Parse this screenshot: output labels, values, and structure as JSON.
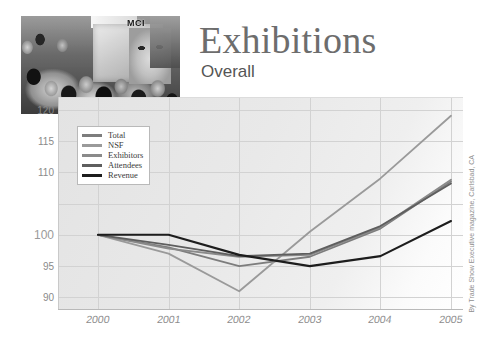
{
  "header": {
    "title": "Exhibitions",
    "subtitle": "Overall",
    "photo_alt": "trade-show-crowd-photo",
    "photo_sign_text": "MCI"
  },
  "credit": "By Trade Show Executive magazine, Carlsbad, CA",
  "chart_data": {
    "type": "line",
    "title": "Exhibitions",
    "subtitle": "Overall",
    "xlabel": "",
    "ylabel": "",
    "x": [
      "2000",
      "2001",
      "2002",
      "2003",
      "2004",
      "2005"
    ],
    "categories": [
      "2000",
      "2001",
      "2002",
      "2003",
      "2004",
      "2005"
    ],
    "ylim": [
      88,
      122
    ],
    "yticks": [
      120,
      115,
      110,
      100,
      95,
      90
    ],
    "ytick_labels": [
      "120",
      "115",
      "110",
      "100",
      "95",
      "90"
    ],
    "grid": true,
    "legend_position": "top-left",
    "series": [
      {
        "name": "Total",
        "color": "#7d7d7d",
        "values": [
          100,
          98.0,
          95.0,
          96.5,
          101.0,
          108.5
        ]
      },
      {
        "name": "NSF",
        "color": "#9a9a9a",
        "values": [
          100,
          97.0,
          91.0,
          100.5,
          109.0,
          119.0
        ]
      },
      {
        "name": "Exhibitors",
        "color": "#8a8a8a",
        "values": [
          100,
          97.8,
          96.5,
          96.8,
          101.2,
          108.8
        ]
      },
      {
        "name": "Attendees",
        "color": "#5e5e5e",
        "values": [
          100,
          98.4,
          96.6,
          97.0,
          101.4,
          108.2
        ]
      },
      {
        "name": "Revenue",
        "color": "#1d1d1d",
        "values": [
          100,
          100.0,
          96.8,
          95.0,
          96.6,
          102.2
        ]
      }
    ]
  }
}
